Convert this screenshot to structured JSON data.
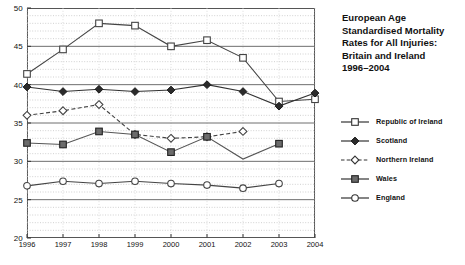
{
  "chart_data": {
    "type": "line",
    "title_lines": [
      "European Age",
      "Standardised Mortality",
      "Rates for All Injuries:",
      "Britain and Ireland",
      "1996–2004"
    ],
    "xlabel": "",
    "ylabel": "",
    "x": [
      1996,
      1997,
      1998,
      1999,
      2000,
      2001,
      2002,
      2003,
      2004
    ],
    "categories": [
      "1996",
      "1997",
      "1998",
      "1999",
      "2000",
      "2001",
      "2002",
      "2003",
      "2004"
    ],
    "xlim": [
      1996,
      2004
    ],
    "ylim": [
      20,
      50
    ],
    "y_ticks": [
      20,
      25,
      30,
      35,
      40,
      45,
      50
    ],
    "y_tick_labels": [
      "20",
      "25",
      "30",
      "35",
      "40",
      "45",
      "50"
    ],
    "y_minor_step": 1,
    "grid": "major solid horizontal, minor dotted horizontal and vertical",
    "legend_position": "right",
    "series": [
      {
        "name": "Republic of Ireland",
        "marker": "open-square",
        "line": "solid",
        "color": "#444444",
        "x": [
          1996,
          1997,
          1998,
          1999,
          2000,
          2001,
          2002,
          2003,
          2004
        ],
        "values": [
          41.4,
          44.6,
          48.0,
          47.7,
          45.0,
          45.8,
          43.5,
          37.8,
          38.1
        ]
      },
      {
        "name": "Scotland",
        "marker": "filled-diamond",
        "line": "solid",
        "color": "#333333",
        "x": [
          1996,
          1997,
          1998,
          1999,
          2000,
          2001,
          2002,
          2003,
          2004
        ],
        "values": [
          39.7,
          39.1,
          39.4,
          39.1,
          39.3,
          40.0,
          39.1,
          37.2,
          38.9
        ]
      },
      {
        "name": "Northern Ireland",
        "marker": "open-diamond",
        "line": "dashed",
        "color": "#444444",
        "x": [
          1996,
          1997,
          1998,
          1999,
          2000,
          2001,
          2002
        ],
        "values": [
          36.0,
          36.6,
          37.4,
          33.5,
          33.0,
          33.2,
          33.9
        ]
      },
      {
        "name": "Wales",
        "marker": "filled-square",
        "line": "solid",
        "color": "#555555",
        "x": [
          1996,
          1997,
          1998,
          1999,
          2000,
          2001,
          2002,
          2003
        ],
        "values": [
          32.4,
          32.2,
          33.9,
          33.5,
          31.2,
          33.2,
          30.3,
          32.3
        ]
      },
      {
        "name": "England",
        "marker": "open-circle",
        "line": "solid",
        "color": "#444444",
        "x": [
          1996,
          1997,
          1998,
          1999,
          2000,
          2001,
          2002,
          2003
        ],
        "values": [
          26.8,
          27.4,
          27.1,
          27.4,
          27.1,
          26.9,
          26.5,
          27.1
        ]
      }
    ]
  },
  "legend": {
    "items": [
      {
        "label": "Republic of Ireland",
        "marker": "open-square",
        "line": "solid"
      },
      {
        "label": "Scotland",
        "marker": "filled-diamond",
        "line": "solid"
      },
      {
        "label": "Northern Ireland",
        "marker": "open-diamond",
        "line": "dashed"
      },
      {
        "label": "Wales",
        "marker": "filled-square",
        "line": "solid"
      },
      {
        "label": "England",
        "marker": "open-circle",
        "line": "solid"
      }
    ]
  }
}
